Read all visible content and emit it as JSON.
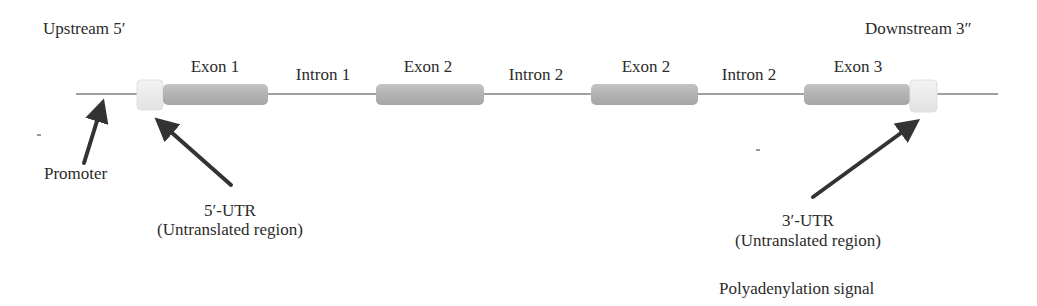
{
  "labels": {
    "upstream": "Upstream 5′",
    "downstream": "Downstream 3″",
    "promoter": "Promoter",
    "utr5_title": "5′-UTR",
    "utr5_sub": "(Untranslated region)",
    "utr3_title": "3′-UTR",
    "utr3_sub": "(Untranslated region)",
    "polyadenylation": "Polyadenylation signal"
  },
  "segments": [
    {
      "type": "exon",
      "label": "Exon 1"
    },
    {
      "type": "intron",
      "label": "Intron 1"
    },
    {
      "type": "exon",
      "label": "Exon 2"
    },
    {
      "type": "intron",
      "label": "Intron 2"
    },
    {
      "type": "exon",
      "label": "Exon 2"
    },
    {
      "type": "intron",
      "label": "Intron 2"
    },
    {
      "type": "exon",
      "label": "Exon 3"
    }
  ],
  "colors": {
    "line": "#9c9c9c",
    "exon": "#b5b5b5",
    "utr": "#ededed",
    "arrow": "#333333",
    "text": "#2b2b2b"
  }
}
